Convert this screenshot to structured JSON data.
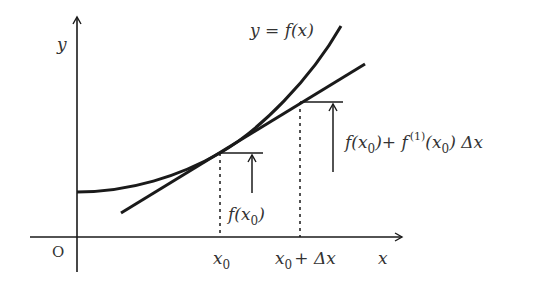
{
  "diagram": {
    "colors": {
      "stroke": "#1a1a1a",
      "text": "#333333",
      "background": "#ffffff"
    },
    "axes": {
      "x_label": "x",
      "y_label": "y",
      "origin_label": "O"
    },
    "curve": {
      "label": "y = f(x)"
    },
    "tick_labels": {
      "x0": "x",
      "x0_sub": "0",
      "x0_plus_dx_x": "x",
      "x0_plus_dx_sub": "0",
      "x0_plus_dx_rest": "+ Δx"
    },
    "annotations": {
      "f_x0": {
        "pre": "f(x",
        "sub": "0",
        "post": ")"
      },
      "approx": {
        "part1_pre": "f(x",
        "part1_sub": "0",
        "part1_post": ")+ f",
        "sup": "(1)",
        "part2_pre": "(x",
        "part2_sub": "0",
        "part2_post": ") Δx"
      }
    }
  }
}
